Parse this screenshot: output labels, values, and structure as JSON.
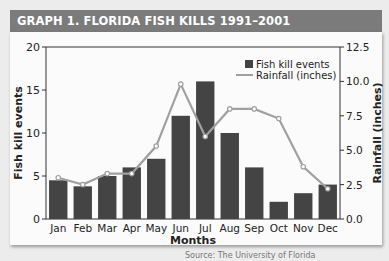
{
  "header": {
    "title": "GRAPH 1. FLORIDA FISH KILLS 1991–2001"
  },
  "footer": {
    "source": "Source: The University of Florida"
  },
  "colors": {
    "banner": "#7b7b7b",
    "bars": "#444444",
    "line": "#a0a0a0",
    "marker_fill": "#ffffff"
  },
  "chart_data": {
    "type": "bar",
    "title": "GRAPH 1. FLORIDA FISH KILLS 1991–2001",
    "xlabel": "Months",
    "ylabel": "Fish kill events",
    "y2label": "Rainfall (inches)",
    "categories": [
      "Jan",
      "Feb",
      "Mar",
      "Apr",
      "May",
      "Jun",
      "Jul",
      "Aug",
      "Sep",
      "Oct",
      "Nov",
      "Dec"
    ],
    "series": [
      {
        "name": "Fish kill events",
        "type": "bar",
        "axis": "left",
        "values": [
          4.5,
          3.8,
          5,
          6,
          7,
          12,
          16,
          10,
          6,
          2,
          3,
          4
        ]
      },
      {
        "name": "Rainfall (inches)",
        "type": "line",
        "axis": "right",
        "values": [
          3.0,
          2.5,
          3.3,
          3.3,
          5.3,
          9.8,
          6.0,
          8.0,
          8.0,
          7.3,
          3.8,
          2.2
        ]
      }
    ],
    "ylim": [
      0,
      20
    ],
    "yticks": [
      "0",
      "5",
      "10",
      "15",
      "20"
    ],
    "y2lim": [
      0,
      12.5
    ],
    "y2ticks": [
      "0.0",
      "2.5",
      "5.0",
      "7.5",
      "10.0",
      "12.5"
    ],
    "legend": {
      "position": "upper right",
      "entries": [
        "Fish kill events",
        "Rainfall (inches)"
      ]
    },
    "grid": false
  }
}
